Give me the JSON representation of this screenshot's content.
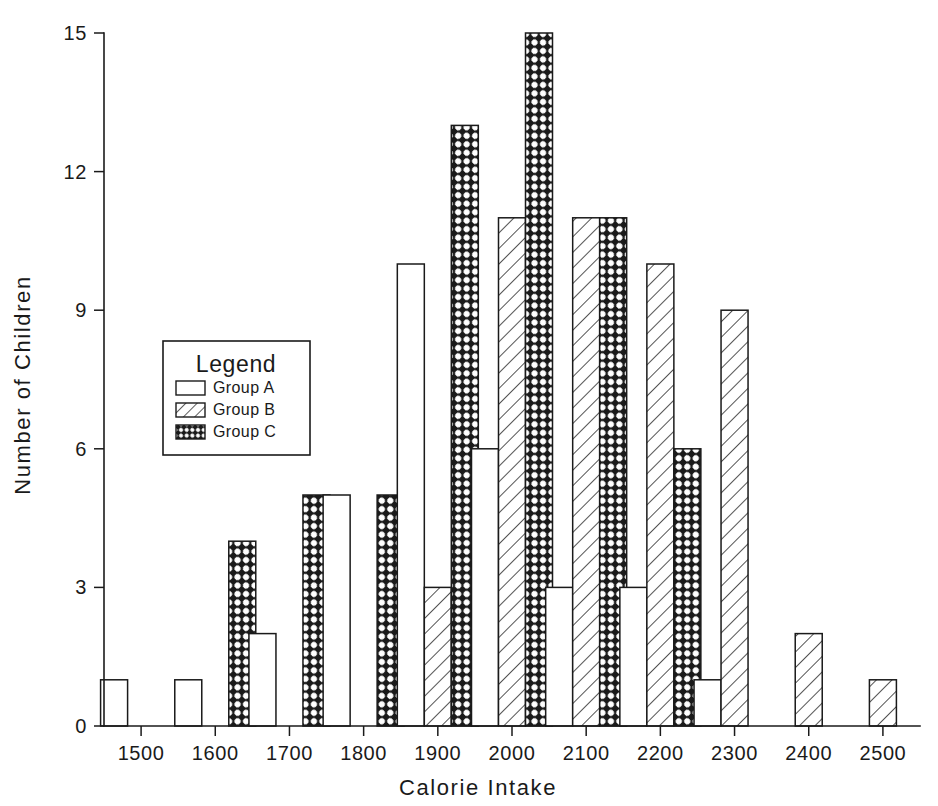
{
  "chart_data": {
    "type": "bar",
    "title": "",
    "subtitle": "",
    "xlabel": "Calorie Intake",
    "ylabel": "Number of Children",
    "categories": [
      "1500",
      "1600",
      "1700",
      "1800",
      "1900",
      "2000",
      "2100",
      "2200",
      "2300",
      "2400",
      "2500"
    ],
    "series": [
      {
        "name": "Group A",
        "fill": "solid-white",
        "values": [
          1,
          1,
          2,
          5,
          10,
          6,
          3,
          3,
          1,
          0,
          0
        ]
      },
      {
        "name": "Group B",
        "fill": "diagonal-hatch",
        "values": [
          0,
          0,
          0,
          0,
          3,
          11,
          11,
          10,
          9,
          2,
          1
        ]
      },
      {
        "name": "Group C",
        "fill": "cross-hatch-dark",
        "values": [
          0,
          4,
          5,
          5,
          13,
          15,
          11,
          6,
          0,
          0,
          0
        ]
      }
    ],
    "xlim": [
      1450,
      2550
    ],
    "ylim": [
      0,
      15
    ],
    "xticks": [
      1500,
      1600,
      1700,
      1800,
      1900,
      2000,
      2100,
      2200,
      2300,
      2400,
      2500
    ],
    "yticks": [
      0,
      3,
      6,
      9,
      12,
      15
    ],
    "ytick_labels": [
      "0",
      "3",
      "6",
      "9",
      "12",
      "15"
    ],
    "xtick_labels": [
      "1500",
      "1600",
      "1700",
      "1800",
      "1900",
      "2000",
      "2100",
      "2200",
      "2300",
      "2400",
      "2500"
    ],
    "grid": false,
    "legend_position": "inside-left-middle",
    "colors": {
      "axis": "#1a1a1a",
      "bar_outline": "#1a1a1a",
      "group_a_fill": "#ffffff",
      "group_b_fill": "#ffffff",
      "group_c_fill": "#1a1a1a",
      "background": "#ffffff"
    }
  },
  "legend": {
    "title": "Legend",
    "entries": [
      {
        "label": "Group A"
      },
      {
        "label": "Group B"
      },
      {
        "label": "Group C"
      }
    ]
  },
  "axes": {
    "y_title": "Number of Children",
    "x_title": "Calorie Intake"
  }
}
